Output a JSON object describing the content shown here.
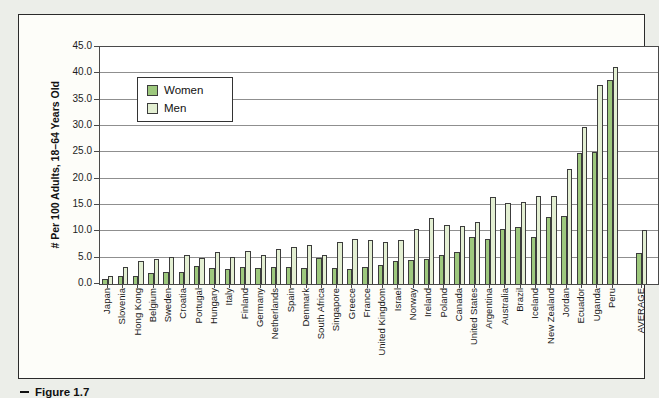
{
  "figure": {
    "caption": "Figure 1.7"
  },
  "chart_data": {
    "type": "bar",
    "title": "",
    "xlabel": "",
    "ylabel": "# Per 100 Adults, 18–64 Years Old",
    "ylim": [
      0,
      45
    ],
    "ytick_step": 5,
    "ytick_labels": [
      "45.0",
      "40.0",
      "35.0",
      "30.0",
      "25.0",
      "20.0",
      "15.0",
      "10.0",
      "5.0",
      "0.0"
    ],
    "grid": true,
    "legend_position": "upper-left-inside",
    "gap_before_last_category": true,
    "categories": [
      "Japan",
      "Slovenia",
      "Hong Kong",
      "Belgium",
      "Sweden",
      "Croatia",
      "Portugal",
      "Hungary",
      "Italy",
      "Finland",
      "Germany",
      "Netherlands",
      "Spain",
      "Denmark",
      "South Africa",
      "Singapore",
      "Greece",
      "France",
      "United Kingdom",
      "Israel",
      "Norway",
      "Ireland",
      "Poland",
      "Canada",
      "United States",
      "Argentina",
      "Australia",
      "Brazil",
      "Iceland",
      "New Zealand",
      "Jordan",
      "Ecuador",
      "Uganda",
      "Peru",
      "AVERAGE"
    ],
    "series": [
      {
        "name": "Women",
        "color": "#9dc87d",
        "values": [
          1.0,
          1.5,
          1.5,
          2.0,
          2.3,
          2.3,
          3.5,
          3.0,
          2.8,
          3.2,
          3.0,
          3.2,
          3.3,
          3.0,
          5.0,
          3.0,
          2.9,
          3.2,
          3.6,
          4.3,
          4.5,
          4.7,
          5.5,
          6.0,
          9.0,
          8.6,
          10.4,
          10.8,
          9.0,
          12.8,
          13.0,
          24.8,
          25.1,
          38.8,
          5.8
        ]
      },
      {
        "name": "Men",
        "color": "#e3efd2",
        "values": [
          1.5,
          3.3,
          4.3,
          4.8,
          5.1,
          5.6,
          5.0,
          6.0,
          5.2,
          6.2,
          5.5,
          6.7,
          7.0,
          7.5,
          5.5,
          8.0,
          8.5,
          8.3,
          8.0,
          8.3,
          10.4,
          12.6,
          11.2,
          11.0,
          11.7,
          16.5,
          15.3,
          15.5,
          16.8,
          16.7,
          21.8,
          29.9,
          37.7,
          41.2,
          10.2
        ]
      }
    ]
  }
}
